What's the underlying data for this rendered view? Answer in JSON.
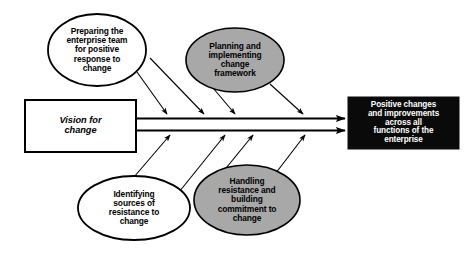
{
  "diagram": {
    "type": "fishbone-cause-and-effect",
    "title": "",
    "colors": {
      "background": "#ffffff",
      "stroke": "#000000",
      "ellipse_fill_plain": "#ffffff",
      "ellipse_fill_shaded": "#a8a8a8",
      "outcome_fill": "#0a0a0a",
      "outcome_text": "#ffffff"
    },
    "input_box": {
      "label": "Vision for\nchange",
      "fill": "#ffffff",
      "text_color": "#000000"
    },
    "outcome_box": {
      "label": "Positive changes\nand improvements\nacross all\nfunctions of the\nenterprise",
      "fill": "#0a0a0a",
      "text_color": "#ffffff"
    },
    "factors": [
      {
        "id": "preparing-team",
        "label": "Preparing the\nenterprise team\nfor positive\nresponse to\nchange",
        "position": "top-left",
        "fill": "#ffffff",
        "arrow_count": 2
      },
      {
        "id": "planning-framework",
        "label": "Planning and\nimplementing\nchange\nframework",
        "position": "top-right",
        "fill": "#a8a8a8",
        "arrow_count": 2
      },
      {
        "id": "identifying-resistance",
        "label": "Identifying\nsources of\nresistance to\nchange",
        "position": "bottom-left",
        "fill": "#ffffff",
        "arrow_count": 2
      },
      {
        "id": "handling-resistance",
        "label": "Handling\nresistance and\nbuilding\ncommitment to\nchange",
        "position": "bottom-right",
        "fill": "#a8a8a8",
        "arrow_count": 2
      }
    ],
    "spines": [
      {
        "id": "upper-spine",
        "direction": "left-to-right"
      },
      {
        "id": "lower-spine",
        "direction": "left-to-right"
      }
    ]
  }
}
